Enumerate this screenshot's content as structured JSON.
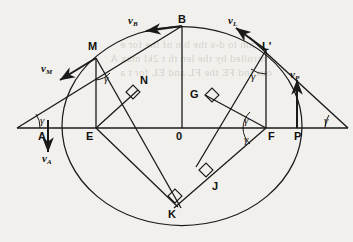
{
  "figure": {
    "type": "geometry-diagram",
    "points": [
      {
        "id": "A",
        "label": "A",
        "x": 44,
        "y": 137
      },
      {
        "id": "B",
        "label": "B",
        "x": 184,
        "y": 23
      },
      {
        "id": "E",
        "label": "E",
        "x": 90,
        "y": 137
      },
      {
        "id": "M",
        "label": "M",
        "x": 92,
        "y": 50
      },
      {
        "id": "N",
        "label": "N",
        "x": 137,
        "y": 86
      },
      {
        "id": "O",
        "label": "0",
        "x": 178,
        "y": 137
      },
      {
        "id": "G",
        "label": "G",
        "x": 204,
        "y": 97
      },
      {
        "id": "L",
        "label": "L'",
        "x": 262,
        "y": 51
      },
      {
        "id": "F",
        "label": "F",
        "x": 270,
        "y": 137
      },
      {
        "id": "P",
        "label": "P",
        "x": 297,
        "y": 137
      },
      {
        "id": "J",
        "label": "J",
        "x": 214,
        "y": 188
      },
      {
        "id": "K",
        "label": "K",
        "x": 173,
        "y": 215
      }
    ],
    "vectors": [
      {
        "id": "vM",
        "label": "v",
        "sub": "M",
        "x": 47,
        "y": 69
      },
      {
        "id": "vB",
        "label": "v",
        "sub": "B",
        "x": 134,
        "y": 20
      },
      {
        "id": "vL",
        "label": "v",
        "sub": "L",
        "x": 232,
        "y": 21
      },
      {
        "id": "vP",
        "label": "v",
        "sub": "P",
        "x": 296,
        "y": 75
      },
      {
        "id": "vA",
        "label": "v",
        "sub": "A",
        "x": 50,
        "y": 158
      }
    ],
    "angles": [
      {
        "id": "gamma-left",
        "label": "γ",
        "x": 41,
        "y": 125
      },
      {
        "id": "gamma-M",
        "label": "γ",
        "x": 104,
        "y": 84
      },
      {
        "id": "gamma-L",
        "label": "γ",
        "x": 254,
        "y": 81
      },
      {
        "id": "gamma-F-upper",
        "label": "γ",
        "x": 249,
        "y": 125
      },
      {
        "id": "gamma-F-lower",
        "label": "γ",
        "x": 249,
        "y": 141
      },
      {
        "id": "gamma-right",
        "label": "γ",
        "x": 325,
        "y": 125
      }
    ],
    "colors": {
      "ink": "#1a1a1a",
      "paper": "#f2f0ec"
    }
  },
  "bleed_text": {
    "lines": [
      "mn to d-s the b   n   nf the for e",
      "ntrolled by  the  len th  t   2kl max  A",
      "ous    ind  FE  the  FL  and  EL  for  t  a"
    ]
  }
}
